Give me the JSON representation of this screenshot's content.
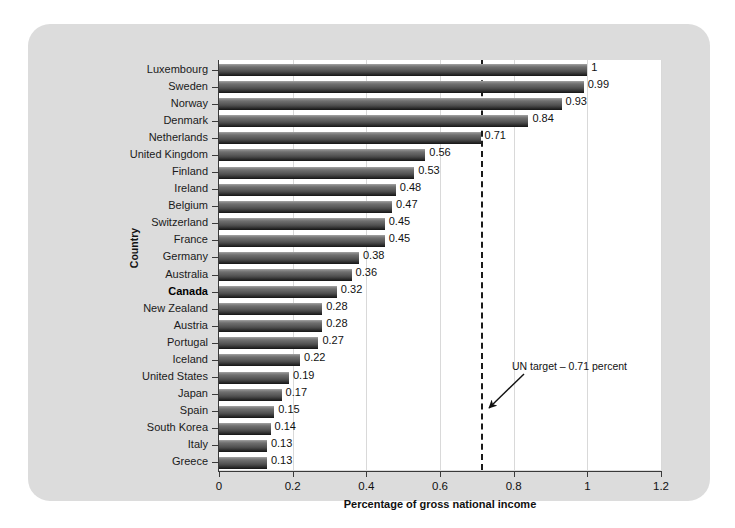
{
  "chart_data": {
    "type": "bar",
    "orientation": "horizontal",
    "title": "",
    "xlabel": "Percentage of gross national income",
    "ylabel": "Country",
    "xlim": [
      0,
      1.2
    ],
    "xticks": [
      "0",
      "0.2",
      "0.4",
      "0.6",
      "0.8",
      "1",
      "1.2"
    ],
    "xtick_values": [
      0,
      0.2,
      0.4,
      0.6,
      0.8,
      1,
      1.2
    ],
    "grid": "vertical-dotted",
    "legend": "none",
    "categories": [
      "Luxembourg",
      "Sweden",
      "Norway",
      "Denmark",
      "Netherlands",
      "United Kingdom",
      "Finland",
      "Ireland",
      "Belgium",
      "Switzerland",
      "France",
      "Germany",
      "Australia",
      "Canada",
      "New Zealand",
      "Austria",
      "Portugal",
      "Iceland",
      "United States",
      "Japan",
      "Spain",
      "South Korea",
      "Italy",
      "Greece"
    ],
    "values": [
      1,
      0.99,
      0.93,
      0.84,
      0.71,
      0.56,
      0.53,
      0.48,
      0.47,
      0.45,
      0.45,
      0.38,
      0.36,
      0.32,
      0.28,
      0.28,
      0.27,
      0.22,
      0.19,
      0.17,
      0.15,
      0.14,
      0.13,
      0.13
    ],
    "value_labels": [
      "1",
      "0.99",
      "0.93",
      "0.84",
      "0.71",
      "0.56",
      "0.53",
      "0.48",
      "0.47",
      "0.45",
      "0.45",
      "0.38",
      "0.36",
      "0.32",
      "0.28",
      "0.28",
      "0.27",
      "0.22",
      "0.19",
      "0.17",
      "0.15",
      "0.14",
      "0.13",
      "0.13"
    ],
    "highlight_category": "Canada",
    "reference_line": {
      "value": 0.71,
      "style": "dashed",
      "label": "UN target – 0.71 percent"
    },
    "colors": {
      "bar_top": "#8d8d8d",
      "bar_bottom": "#141414",
      "panel_background": "#dcdcdc",
      "plot_background": "#ffffff",
      "axis": "#3a3a3a",
      "gridline": "#d9d9d9",
      "text": "#111111"
    }
  }
}
